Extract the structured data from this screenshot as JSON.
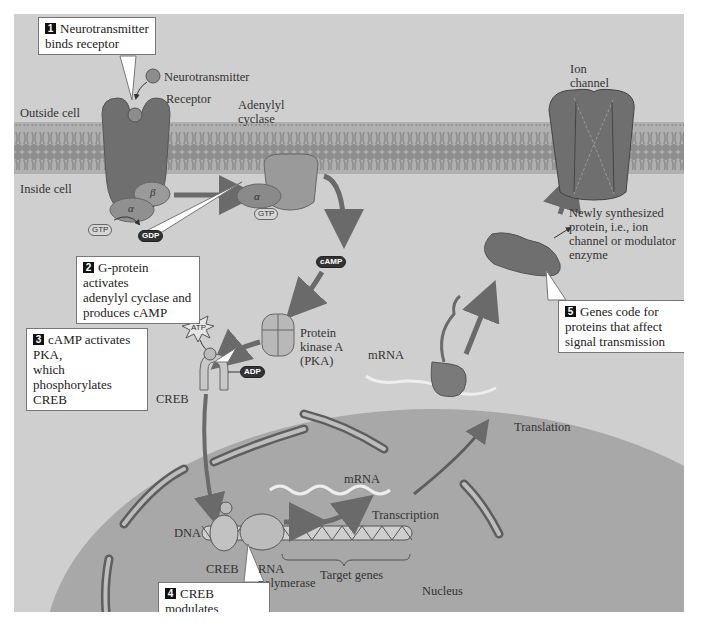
{
  "figure": {
    "colors": {
      "background": "#cfcfcf",
      "membrane": "#9a9a9a",
      "receptor": "#6f6f6f",
      "nucleus": "#a8a8a8",
      "arrow": "#6a6a6a",
      "callout_bg": "#ffffff",
      "callout_num_bg": "#111111"
    }
  },
  "regions": {
    "outside_cell": "Outside cell",
    "inside_cell": "Inside cell",
    "nucleus": "Nucleus"
  },
  "labels": {
    "neurotransmitter": "Neurotransmitter",
    "receptor": "Receptor",
    "adenylyl_cyclase": "Adenylyl cyclase",
    "alpha": "α",
    "beta": "β",
    "gtp": "GTP",
    "gdp": "GDP",
    "camp": "cAMP",
    "pka": "Protein kinase A (PKA)",
    "atp": "ATP",
    "adp": "ADP",
    "phosphate": "P",
    "creb_cytoplasm": "CREB",
    "creb_nucleus": "CREB",
    "dna": "DNA",
    "rna_polymerase": "RNA polymerase",
    "target_genes": "Target genes",
    "mrna_nucleus": "mRNA",
    "transcription": "Transcription",
    "mrna_cytoplasm": "mRNA",
    "translation": "Translation",
    "ion_channel": "Ion channel",
    "new_protein": "Newly synthesized protein, i.e., ion channel or modulator enzyme"
  },
  "callouts": [
    {
      "num": "1",
      "text": "Neurotransmitter\nbinds receptor"
    },
    {
      "num": "2",
      "text": "G-protein activates\nadenylyl cyclase and\nproduces cAMP"
    },
    {
      "num": "3",
      "text": "cAMP activates PKA,\nwhich phosphorylates\nCREB"
    },
    {
      "num": "4",
      "text": "CREB modulates\ngene transcription"
    },
    {
      "num": "5",
      "text": "Genes code for\nproteins that affect\nsignal transmission"
    }
  ]
}
